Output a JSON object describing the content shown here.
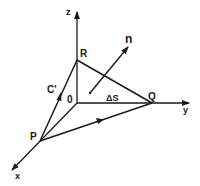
{
  "diagram": {
    "type": "3d-coordinate-surface-element",
    "colors": {
      "stroke": "#1a1a1a",
      "background": "#ffffff"
    },
    "axes": [
      {
        "name": "z",
        "label": "z"
      },
      {
        "name": "y",
        "label": "y"
      },
      {
        "name": "x",
        "label": "x"
      }
    ],
    "points": [
      {
        "name": "O",
        "label": "0"
      },
      {
        "name": "R",
        "label": "R"
      },
      {
        "name": "Q",
        "label": "Q"
      },
      {
        "name": "P",
        "label": "P"
      }
    ],
    "curve_label": "C'",
    "normal_label": "n",
    "area_label": "ΔS"
  }
}
